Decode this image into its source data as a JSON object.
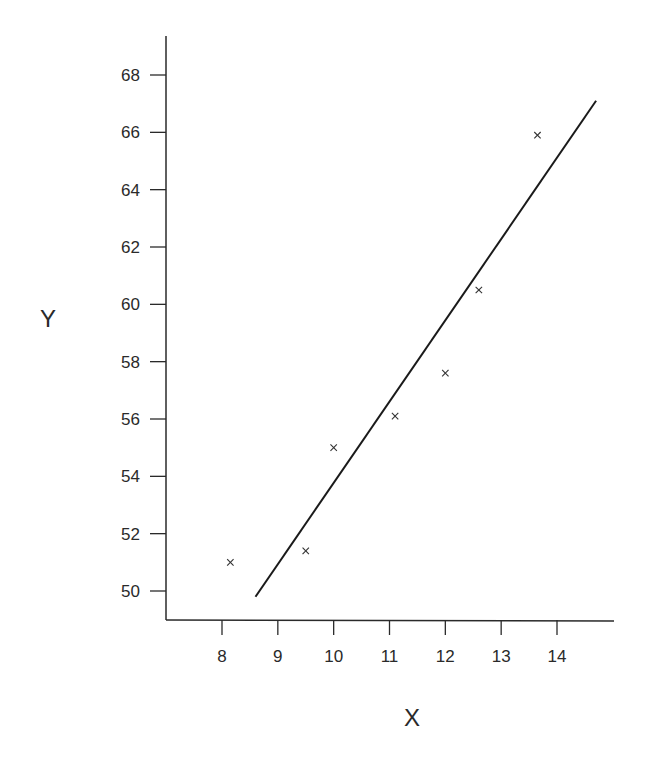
{
  "chart_data": {
    "type": "scatter",
    "title": "",
    "xlabel": "X",
    "ylabel": "Y",
    "xlim": [
      7.0,
      15.0
    ],
    "ylim": [
      49.0,
      69.0
    ],
    "x_ticks": [
      8,
      9,
      10,
      11,
      12,
      13,
      14
    ],
    "y_ticks": [
      50,
      52,
      54,
      56,
      58,
      60,
      62,
      64,
      66,
      68
    ],
    "grid": false,
    "legend": null,
    "marker": "x",
    "points": [
      {
        "x": 8.15,
        "y": 51.0
      },
      {
        "x": 9.5,
        "y": 51.4
      },
      {
        "x": 10.0,
        "y": 55.0
      },
      {
        "x": 11.1,
        "y": 56.1
      },
      {
        "x": 12.0,
        "y": 57.6
      },
      {
        "x": 12.6,
        "y": 60.5
      },
      {
        "x": 13.65,
        "y": 65.9
      }
    ],
    "fit_line": {
      "x0": 8.6,
      "y0": 49.8,
      "x1": 14.7,
      "y1": 67.1
    }
  },
  "layout": {
    "plot": {
      "left": 166,
      "right": 614,
      "top": 36,
      "bottom": 620
    },
    "px": {
      "x8": 222,
      "x14": 557,
      "y50": 591,
      "y68": 75
    },
    "colors": {
      "axis": "#2a2a2a",
      "line": "#1a1a1a",
      "marker": "#333333"
    }
  }
}
